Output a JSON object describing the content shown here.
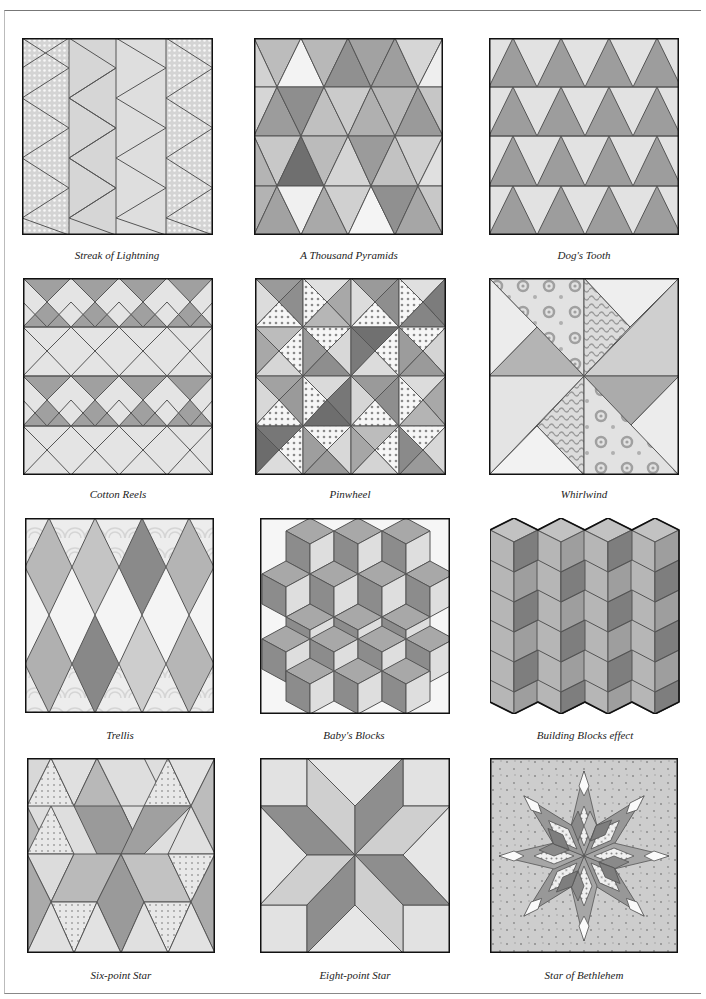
{
  "page": {
    "colors": {
      "light": "#e6e6e6",
      "mid": "#bdbdbd",
      "medium": "#a9a9a9",
      "dark": "#8c8c8c",
      "darker": "#707070",
      "white": "#f6f6f6",
      "line": "#555555",
      "border": "#111111"
    }
  },
  "patterns": [
    {
      "id": "streak-of-lightning",
      "caption": "Streak of Lightning"
    },
    {
      "id": "a-thousand-pyramids",
      "caption": "A Thousand Pyramids"
    },
    {
      "id": "dogs-tooth",
      "caption": "Dog's Tooth"
    },
    {
      "id": "cotton-reels",
      "caption": "Cotton Reels"
    },
    {
      "id": "pinwheel",
      "caption": "Pinwheel"
    },
    {
      "id": "whirlwind",
      "caption": "Whirlwind"
    },
    {
      "id": "trellis",
      "caption": "Trellis"
    },
    {
      "id": "babys-blocks",
      "caption": "Baby's Blocks"
    },
    {
      "id": "building-blocks-effect",
      "caption": "Building Blocks effect"
    },
    {
      "id": "six-point-star",
      "caption": "Six-point Star"
    },
    {
      "id": "eight-point-star",
      "caption": "Eight-point Star"
    },
    {
      "id": "star-of-bethlehem",
      "caption": "Star of Bethlehem"
    }
  ]
}
